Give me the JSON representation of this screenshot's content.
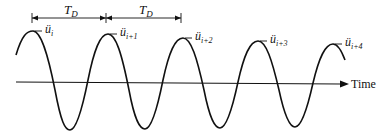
{
  "diagram": {
    "axis_label": "Time",
    "period_label": "T",
    "period_subscript": "D",
    "peaks": [
      {
        "base": "ü",
        "sub": "i",
        "x": 33,
        "y": 31
      },
      {
        "base": "ü",
        "sub": "i+1",
        "x": 108,
        "y": 34
      },
      {
        "base": "ü",
        "sub": "i+2",
        "x": 183,
        "y": 38
      },
      {
        "base": "ü",
        "sub": "i+3",
        "x": 258,
        "y": 41
      },
      {
        "base": "ü",
        "sub": "i+4",
        "x": 333,
        "y": 44
      }
    ],
    "colors": {
      "line": "#111111",
      "background": "#ffffff"
    }
  }
}
